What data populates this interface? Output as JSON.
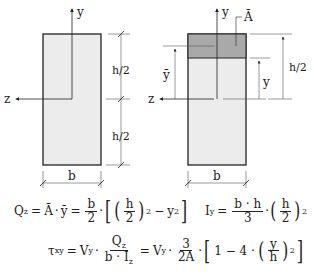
{
  "left_figure": {
    "axis_y_label": "y",
    "axis_z_label": "z",
    "dim_upper_label": "h/2",
    "dim_lower_label": "h/2",
    "width_label": "b"
  },
  "right_figure": {
    "axis_y_label": "y",
    "axis_z_label": "z",
    "area_label": "Ā",
    "centroid_label": "ȳ",
    "y_dim_label": "y",
    "h_half_label": "h/2",
    "width_label": "b"
  },
  "equations": {
    "qz": {
      "lhs": "Q",
      "lhs_sub": "z",
      "eq1": "=",
      "abar": "Ā",
      "dot1": "·",
      "ybar": "ȳ",
      "eq2": "=",
      "frac_num": "b",
      "frac_den": "2",
      "dot2": "·",
      "inner_num": "h",
      "inner_den": "2",
      "exp": "2",
      "minus": "−",
      "y": "y",
      "y_exp": "2"
    },
    "iy": {
      "lhs": "I",
      "lhs_sub": "y",
      "eq": "=",
      "frac_num": "b · h",
      "frac_den": "3",
      "dot": "·",
      "inner_num": "h",
      "inner_den": "2",
      "exp": "2"
    },
    "tau": {
      "lhs": "τ",
      "lhs_sub": "xy",
      "eq1": "=",
      "v1": "V",
      "v1_sub": "y",
      "dot1": "·",
      "f1_num": "Q",
      "f1_num_sub": "z",
      "f1_den": "b · I",
      "f1_den_sub": "z",
      "eq2": "=",
      "v2": "V",
      "v2_sub": "y",
      "dot2": "·",
      "f2_num": "3",
      "f2_den": "2A",
      "dot3": "·",
      "one": "1 − 4 ·",
      "inner_num": "y",
      "inner_den": "h",
      "exp": "2"
    }
  },
  "colors": {
    "light_fill": "#ececec",
    "dark_fill": "#a9a9a9",
    "line": "#222222"
  }
}
